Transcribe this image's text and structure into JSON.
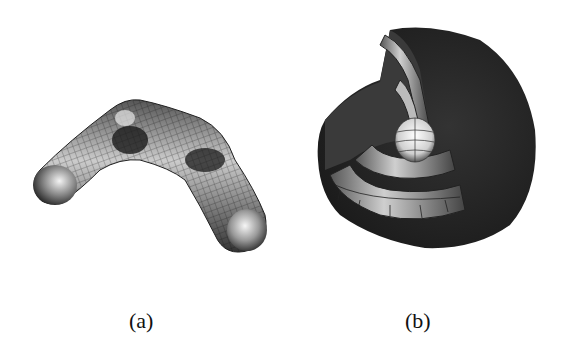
{
  "figure": {
    "panels": [
      {
        "id": "a",
        "label": "(a)",
        "content": "bent-tube-wireframe-surface"
      },
      {
        "id": "b",
        "label": "(b)",
        "content": "nested-spherical-shells-cutaway"
      }
    ]
  }
}
